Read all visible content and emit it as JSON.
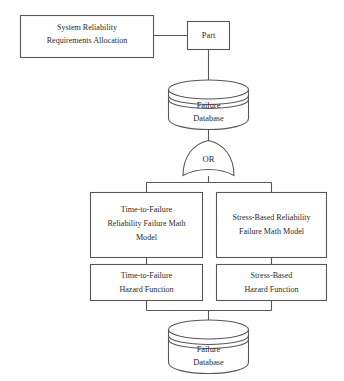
{
  "diagram": {
    "colors": {
      "background": "#ffffff",
      "stroke": "#58585a",
      "text": "#2b2b2b"
    },
    "nodes": {
      "system_requirements": {
        "type": "process-box",
        "lines": [
          "System Reliability",
          "Requirements Allocation"
        ]
      },
      "part": {
        "type": "process-box",
        "lines": [
          "Part"
        ]
      },
      "failure_database_top": {
        "type": "database-cylinder",
        "lines": [
          "Failure",
          "Database"
        ]
      },
      "or_gate": {
        "type": "logic-gate",
        "lines": [
          "OR"
        ]
      },
      "ttf_math_model": {
        "type": "process-box",
        "lines": [
          "Time-to-Failure",
          "Reliability Failure Math",
          "Model"
        ]
      },
      "stress_math_model": {
        "type": "process-box",
        "lines": [
          "Stress-Based Reliability",
          "Failure Math Model"
        ]
      },
      "ttf_hazard_function": {
        "type": "process-box",
        "lines": [
          "Time-to-Failure",
          "Hazard Function"
        ]
      },
      "stress_hazard_function": {
        "type": "process-box",
        "lines": [
          "Stress-Based",
          "Hazard Function"
        ]
      },
      "failure_database_bottom": {
        "type": "database-cylinder",
        "lines": [
          "Failure",
          "Database"
        ]
      }
    }
  }
}
